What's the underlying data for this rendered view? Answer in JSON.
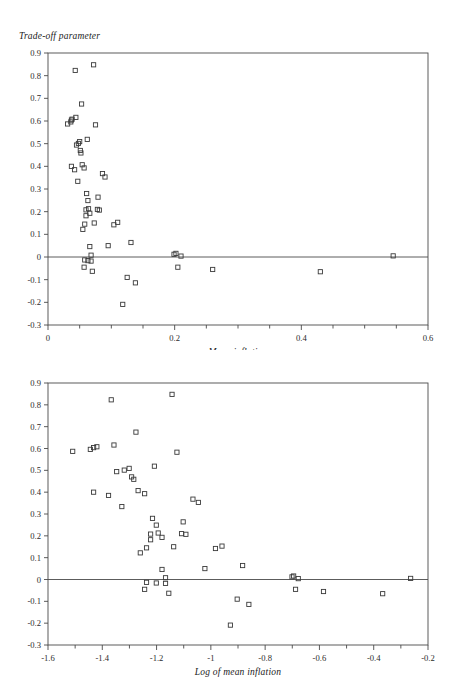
{
  "figure": {
    "panel_top": {
      "y_axis_title": "Trade-off parameter",
      "x_axis_title": "Mean inflation"
    },
    "panel_bottom": {
      "x_axis_title": "Log of mean inflation"
    }
  },
  "chart_data": [
    {
      "type": "scatter",
      "title": "",
      "xlabel": "Mean inflation",
      "ylabel": "Trade-off parameter",
      "xlim": [
        0,
        0.6
      ],
      "ylim": [
        -0.3,
        0.9
      ],
      "xticks": [
        0,
        0.2,
        0.4,
        0.6
      ],
      "xtick_labels": [
        "0",
        "0.2",
        "0.4",
        "0.6"
      ],
      "x_minor_tick_step": 0.05,
      "yticks": [
        -0.3,
        -0.2,
        -0.1,
        0,
        0.1,
        0.2,
        0.3,
        0.4,
        0.5,
        0.6,
        0.7,
        0.8,
        0.9
      ],
      "ytick_labels": [
        "-0.3",
        "-0.2",
        "-0.1",
        "0",
        "0.1",
        "0.2",
        "0.3",
        "0.4",
        "0.5",
        "0.6",
        "0.7",
        "0.8",
        "0.9"
      ],
      "grid": false,
      "legend": false,
      "marker": "open-square",
      "zero_line": true,
      "series": [
        {
          "name": "countries",
          "points": [
            [
              0.031,
              0.587
            ],
            [
              0.036,
              0.596
            ],
            [
              0.037,
              0.604
            ],
            [
              0.038,
              0.608
            ],
            [
              0.037,
              0.4
            ],
            [
              0.043,
              0.823
            ],
            [
              0.044,
              0.616
            ],
            [
              0.042,
              0.385
            ],
            [
              0.045,
              0.494
            ],
            [
              0.047,
              0.334
            ],
            [
              0.048,
              0.501
            ],
            [
              0.05,
              0.509
            ],
            [
              0.051,
              0.47
            ],
            [
              0.052,
              0.459
            ],
            [
              0.053,
              0.675
            ],
            [
              0.054,
              0.407
            ],
            [
              0.055,
              0.122
            ],
            [
              0.057,
              0.393
            ],
            [
              0.058,
              0.145
            ],
            [
              0.06,
              0.208
            ],
            [
              0.06,
              0.182
            ],
            [
              0.061,
              0.28
            ],
            [
              0.062,
              0.519
            ],
            [
              0.063,
              0.249
            ],
            [
              0.064,
              0.213
            ],
            [
              0.066,
              0.193
            ],
            [
              0.066,
              0.046
            ],
            [
              0.063,
              -0.016
            ],
            [
              0.058,
              -0.013
            ],
            [
              0.057,
              -0.045
            ],
            [
              0.068,
              -0.018
            ],
            [
              0.068,
              0.008
            ],
            [
              0.07,
              -0.063
            ],
            [
              0.072,
              0.848
            ],
            [
              0.073,
              0.15
            ],
            [
              0.075,
              0.583
            ],
            [
              0.078,
              0.21
            ],
            [
              0.079,
              0.264
            ],
            [
              0.081,
              0.207
            ],
            [
              0.086,
              0.368
            ],
            [
              0.09,
              0.353
            ],
            [
              0.095,
              0.05
            ],
            [
              0.104,
              0.142
            ],
            [
              0.11,
              0.153
            ],
            [
              0.118,
              -0.209
            ],
            [
              0.125,
              -0.09
            ],
            [
              0.131,
              0.064
            ],
            [
              0.138,
              -0.114
            ],
            [
              0.199,
              0.012
            ],
            [
              0.202,
              0.016
            ],
            [
              0.205,
              -0.045
            ],
            [
              0.21,
              0.004
            ],
            [
              0.26,
              -0.055
            ],
            [
              0.43,
              -0.065
            ],
            [
              0.545,
              0.005
            ]
          ]
        }
      ]
    },
    {
      "type": "scatter",
      "title": "",
      "xlabel": "Log of mean inflation",
      "ylabel": "Trade-off parameter",
      "xlim": [
        -1.6,
        -0.2
      ],
      "ylim": [
        -0.3,
        0.9
      ],
      "xticks": [
        -1.6,
        -1.4,
        -1.2,
        -1,
        -0.8,
        -0.6,
        -0.4,
        -0.2
      ],
      "xtick_labels": [
        "-1.6",
        "-1.4",
        "-1.2",
        "-1",
        "-0.8",
        "-0.6",
        "-0.4",
        "-0.2"
      ],
      "x_minor_tick_step": 0.1,
      "yticks": [
        -0.3,
        -0.2,
        -0.1,
        0,
        0.1,
        0.2,
        0.3,
        0.4,
        0.5,
        0.6,
        0.7,
        0.8,
        0.9
      ],
      "ytick_labels": [
        "-0.3",
        "-0.2",
        "-0.1",
        "0",
        "0.1",
        "0.2",
        "0.3",
        "0.4",
        "0.5",
        "0.6",
        "0.7",
        "0.8",
        "0.9"
      ],
      "grid": false,
      "legend": false,
      "marker": "open-square",
      "zero_line": true,
      "series": [
        {
          "name": "countries",
          "points": [
            [
              -1.509,
              0.587
            ],
            [
              -1.444,
              0.596
            ],
            [
              -1.432,
              0.604
            ],
            [
              -1.42,
              0.608
            ],
            [
              -1.432,
              0.4
            ],
            [
              -1.367,
              0.823
            ],
            [
              -1.357,
              0.616
            ],
            [
              -1.377,
              0.385
            ],
            [
              -1.347,
              0.494
            ],
            [
              -1.328,
              0.334
            ],
            [
              -1.319,
              0.501
            ],
            [
              -1.301,
              0.509
            ],
            [
              -1.292,
              0.47
            ],
            [
              -1.284,
              0.459
            ],
            [
              -1.276,
              0.675
            ],
            [
              -1.268,
              0.407
            ],
            [
              -1.26,
              0.122
            ],
            [
              -1.244,
              0.393
            ],
            [
              -1.237,
              0.145
            ],
            [
              -1.222,
              0.208
            ],
            [
              -1.222,
              0.182
            ],
            [
              -1.215,
              0.28
            ],
            [
              -1.208,
              0.519
            ],
            [
              -1.201,
              0.249
            ],
            [
              -1.194,
              0.213
            ],
            [
              -1.18,
              0.193
            ],
            [
              -1.18,
              0.046
            ],
            [
              -1.201,
              -0.016
            ],
            [
              -1.237,
              -0.013
            ],
            [
              -1.244,
              -0.045
            ],
            [
              -1.167,
              -0.018
            ],
            [
              -1.167,
              0.008
            ],
            [
              -1.155,
              -0.063
            ],
            [
              -1.143,
              0.848
            ],
            [
              -1.137,
              0.15
            ],
            [
              -1.125,
              0.583
            ],
            [
              -1.108,
              0.21
            ],
            [
              -1.102,
              0.264
            ],
            [
              -1.092,
              0.207
            ],
            [
              -1.066,
              0.368
            ],
            [
              -1.046,
              0.353
            ],
            [
              -1.022,
              0.05
            ],
            [
              -0.983,
              0.142
            ],
            [
              -0.959,
              0.153
            ],
            [
              -0.928,
              -0.209
            ],
            [
              -0.903,
              -0.09
            ],
            [
              -0.883,
              0.064
            ],
            [
              -0.86,
              -0.114
            ],
            [
              -0.701,
              0.012
            ],
            [
              -0.695,
              0.016
            ],
            [
              -0.688,
              -0.045
            ],
            [
              -0.678,
              0.004
            ],
            [
              -0.585,
              -0.055
            ],
            [
              -0.367,
              -0.065
            ],
            [
              -0.264,
              0.005
            ]
          ]
        }
      ]
    }
  ]
}
